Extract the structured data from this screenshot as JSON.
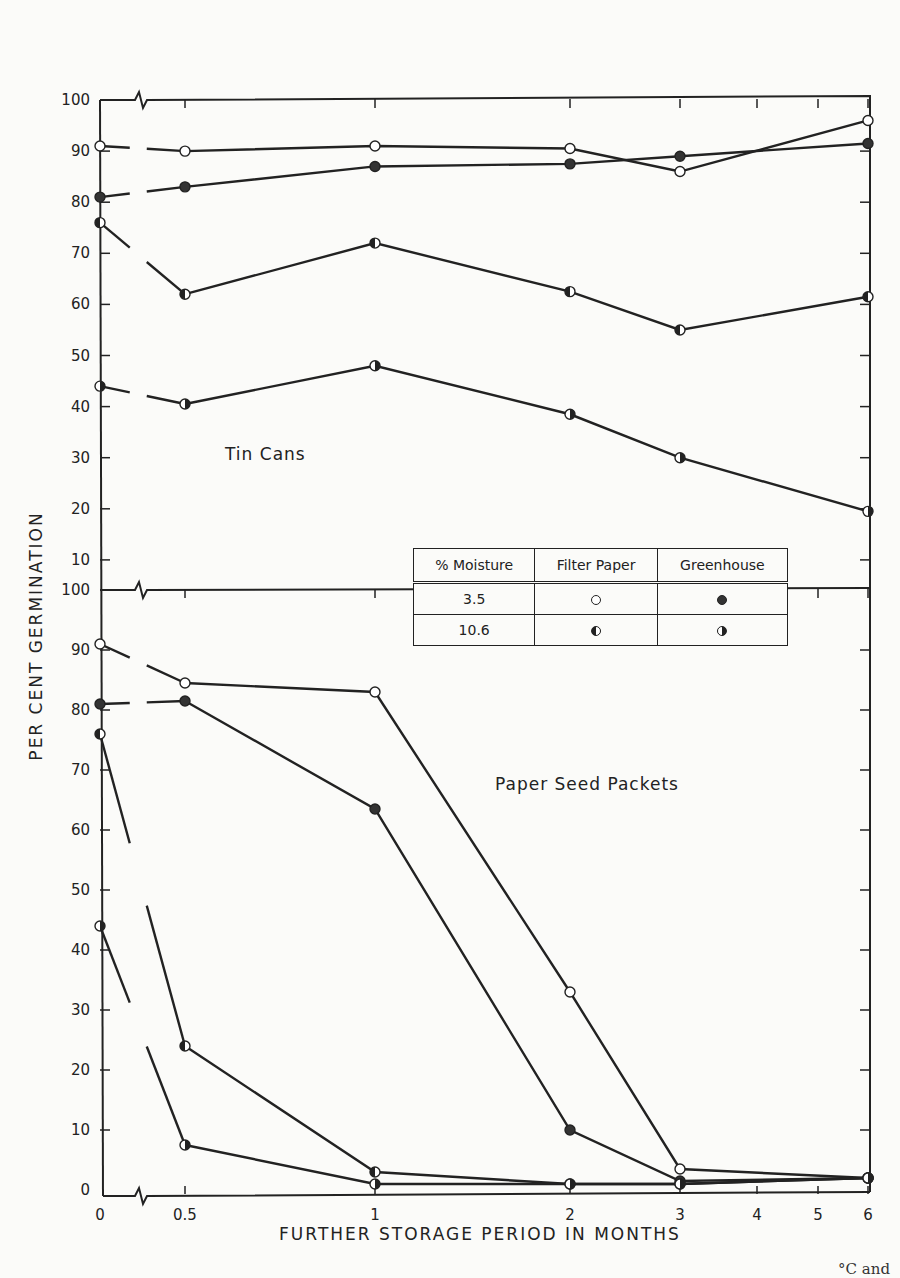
{
  "chart_data": {
    "type": "line",
    "ylabel": "PER CENT GERMINATION",
    "xlabel": "FURTHER STORAGE PERIOD IN MONTHS",
    "x": [
      0,
      0.5,
      1,
      2,
      3,
      6
    ],
    "x_tick_labels": [
      "0",
      "0.5",
      "1",
      "2",
      "3",
      "4",
      "5",
      "6"
    ],
    "x_tick_values": [
      0,
      0.5,
      1,
      2,
      3,
      4,
      5,
      6
    ],
    "axis_break": "between 0 and 0.5 on x; between panels on y",
    "grid": false,
    "panels": [
      {
        "name": "Tin Cans",
        "ylim": [
          10,
          100
        ],
        "y_tick_labels": [
          "100",
          "90",
          "80",
          "70",
          "60",
          "50",
          "40",
          "30",
          "20",
          "10"
        ],
        "series": [
          {
            "name": "3.5% Filter Paper",
            "marker": "open",
            "values": [
              91,
              90,
              91,
              90.5,
              86,
              96
            ]
          },
          {
            "name": "3.5% Greenhouse",
            "marker": "filled",
            "values": [
              81,
              83,
              87,
              87.5,
              89,
              91.5
            ]
          },
          {
            "name": "10.6% Filter Paper",
            "marker": "left-half",
            "values": [
              76,
              62,
              72,
              62.5,
              55,
              61.5
            ]
          },
          {
            "name": "10.6% Greenhouse",
            "marker": "right-half",
            "values": [
              44,
              40.5,
              48,
              38.5,
              30,
              19.5
            ]
          }
        ]
      },
      {
        "name": "Paper Seed Packets",
        "ylim": [
          0,
          100
        ],
        "y_tick_labels": [
          "100",
          "90",
          "80",
          "70",
          "60",
          "50",
          "40",
          "30",
          "20",
          "10",
          "0"
        ],
        "series": [
          {
            "name": "3.5% Filter Paper",
            "marker": "open",
            "values": [
              91,
              84.5,
              83,
              33,
              3.5,
              2
            ]
          },
          {
            "name": "3.5% Greenhouse",
            "marker": "filled",
            "values": [
              81,
              81.5,
              63.5,
              10,
              1.5,
              2
            ]
          },
          {
            "name": "10.6% Filter Paper",
            "marker": "left-half",
            "values": [
              76,
              24,
              3,
              1,
              1,
              2
            ]
          },
          {
            "name": "10.6% Greenhouse",
            "marker": "right-half",
            "values": [
              44,
              7.5,
              1,
              1,
              1,
              2
            ]
          }
        ]
      }
    ],
    "legend": {
      "placement": "center-right",
      "headers": [
        "% Moisture",
        "Filter Paper",
        "Greenhouse"
      ],
      "rows": [
        {
          "moisture": "3.5",
          "filter_paper": "open",
          "greenhouse": "filled"
        },
        {
          "moisture": "10.6",
          "filter_paper": "left-half",
          "greenhouse": "right-half"
        }
      ]
    }
  },
  "caption_fragment": "°C and"
}
